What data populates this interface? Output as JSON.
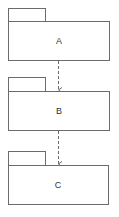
{
  "diagram": {
    "type": "uml-package-diagram",
    "colors": {
      "stroke": "#6b6b6b",
      "fill": "#ffffff",
      "text": "#333333",
      "arrow": "#6b6b6b"
    },
    "packages": [
      {
        "id": "A",
        "label": "A"
      },
      {
        "id": "B",
        "label": "B"
      },
      {
        "id": "C",
        "label": "C"
      }
    ],
    "dependencies": [
      {
        "from": "A",
        "to": "B",
        "style": "dashed",
        "arrowhead": "open"
      },
      {
        "from": "B",
        "to": "C",
        "style": "dashed",
        "arrowhead": "open"
      }
    ]
  }
}
